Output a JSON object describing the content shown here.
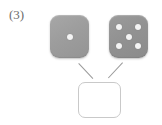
{
  "figure": {
    "label": "(3)",
    "background_color": "#ffffff",
    "label_color": "#6d6d6d",
    "die_color": "#9d9d9d",
    "pip_color": "#f4f4f4",
    "connector_color": "#9a9a9a",
    "answer_box_border_color": "#c9c9c9"
  },
  "dice": [
    {
      "name": "die-one",
      "value": 1,
      "pips": [
        "center"
      ],
      "face_label": "1"
    },
    {
      "name": "die-two",
      "value": 5,
      "pips": [
        "top-left",
        "top-right",
        "center",
        "bottom-left",
        "bottom-right"
      ],
      "face_label": "5"
    }
  ],
  "connectors": [
    {
      "name": "connector-left",
      "from": "die-one",
      "to": "answer-box"
    },
    {
      "name": "connector-right",
      "from": "die-two",
      "to": "answer-box"
    }
  ],
  "answer_box": {
    "value": "",
    "placeholder": ""
  }
}
